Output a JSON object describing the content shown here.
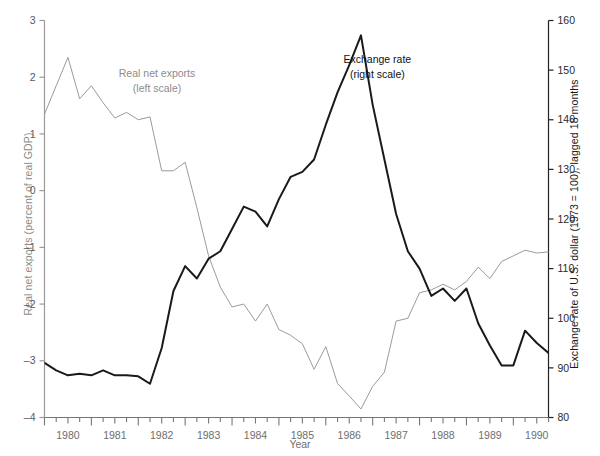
{
  "chart_data": {
    "type": "line",
    "title": "",
    "xlabel": "Year",
    "grid": false,
    "legend_position": "inline-annotations",
    "x_axis": {
      "label": "Year",
      "tick_labels": [
        "1980",
        "1981",
        "1982",
        "1983",
        "1984",
        "1985",
        "1986",
        "1987",
        "1988",
        "1989",
        "1990"
      ],
      "tick_values": [
        1980,
        1981,
        1982,
        1983,
        1984,
        1985,
        1986,
        1987,
        1988,
        1989,
        1990
      ],
      "minor_ticks": "quarterly",
      "xlim": [
        1979.5,
        1990.25
      ]
    },
    "y_axis_left": {
      "label": "Real net exports (percent of real GDP)",
      "tick_labels": [
        "3",
        "2",
        "1",
        "0",
        "–1",
        "–2",
        "–3",
        "–4"
      ],
      "tick_values": [
        3,
        2,
        1,
        0,
        -1,
        -2,
        -3,
        -4
      ],
      "ylim": [
        -4,
        3
      ],
      "color": "#8c8c8c"
    },
    "y_axis_right": {
      "label": "Exchange rate of U.S. dollar (1973 = 100), lagged 18 months",
      "tick_labels": [
        "160",
        "150",
        "140",
        "130",
        "120",
        "110",
        "100",
        "90",
        "80"
      ],
      "tick_values": [
        160,
        150,
        140,
        130,
        120,
        110,
        100,
        90,
        80
      ],
      "ylim": [
        80,
        160
      ],
      "color": "#1a1a1a"
    },
    "annotations": [
      {
        "name": "real-net-exports-label",
        "text": "Real net exports",
        "sub": "(left scale)",
        "color": "#8c8c8c",
        "x": 1981.9,
        "y": 2.0
      },
      {
        "name": "exchange-rate-label",
        "text": "Exchange rate",
        "sub": "(right scale)",
        "color": "#111111",
        "x": 1986.6,
        "y": 2.25
      }
    ],
    "series": [
      {
        "name": "Real net exports",
        "axis": "left",
        "color": "#9a9a9a",
        "unit": "percent of real GDP",
        "x": [
          1979.5,
          1979.75,
          1980.0,
          1980.25,
          1980.5,
          1980.75,
          1981.0,
          1981.25,
          1981.5,
          1981.75,
          1982.0,
          1982.25,
          1982.5,
          1982.75,
          1983.0,
          1983.25,
          1983.5,
          1983.75,
          1984.0,
          1984.25,
          1984.5,
          1984.75,
          1985.0,
          1985.25,
          1985.5,
          1985.75,
          1986.0,
          1986.25,
          1986.5,
          1986.75,
          1987.0,
          1987.25,
          1987.5,
          1987.75,
          1988.0,
          1988.25,
          1988.5,
          1988.75,
          1989.0,
          1989.25,
          1989.5,
          1989.75,
          1990.0,
          1990.25
        ],
        "y": [
          1.35,
          1.85,
          2.35,
          1.62,
          1.85,
          1.55,
          1.28,
          1.38,
          1.25,
          1.3,
          0.35,
          0.35,
          0.5,
          -0.3,
          -1.15,
          -1.7,
          -2.05,
          -2.0,
          -2.3,
          -2.0,
          -2.45,
          -2.55,
          -2.7,
          -3.15,
          -2.75,
          -3.4,
          -3.62,
          -3.85,
          -3.45,
          -3.2,
          -2.3,
          -2.25,
          -1.8,
          -1.75,
          -1.65,
          -1.75,
          -1.6,
          -1.35,
          -1.55,
          -1.25,
          -1.15,
          -1.05,
          -1.1,
          -1.08
        ]
      },
      {
        "name": "Exchange rate",
        "axis": "right",
        "color": "#1a1a1a",
        "unit": "index, 1973 = 100",
        "x": [
          1979.5,
          1979.75,
          1980.0,
          1980.25,
          1980.5,
          1980.75,
          1981.0,
          1981.25,
          1981.5,
          1981.75,
          1982.0,
          1982.25,
          1982.5,
          1982.75,
          1983.0,
          1983.25,
          1983.5,
          1983.75,
          1984.0,
          1984.25,
          1984.5,
          1984.75,
          1985.0,
          1985.25,
          1985.5,
          1985.75,
          1986.0,
          1986.25,
          1986.5,
          1986.75,
          1987.0,
          1987.25,
          1987.5,
          1987.75,
          1988.0,
          1988.25,
          1988.5,
          1988.75,
          1989.0,
          1989.25,
          1989.5,
          1989.75,
          1990.0,
          1990.25
        ],
        "y": [
          91.0,
          89.5,
          88.5,
          88.8,
          88.5,
          89.5,
          88.5,
          88.5,
          88.3,
          86.8,
          94.0,
          105.5,
          110.5,
          108.0,
          112.0,
          113.5,
          118.0,
          122.5,
          121.5,
          118.5,
          124.0,
          128.5,
          129.5,
          132.0,
          139.0,
          145.5,
          151.0,
          157.0,
          143.0,
          132.0,
          121.0,
          113.5,
          110.0,
          104.5,
          106.0,
          103.5,
          106.0,
          99.0,
          94.5,
          90.5,
          90.5,
          97.5,
          95.0,
          93.0
        ]
      }
    ]
  },
  "axis_titles": {
    "left": "Real net exports (percent of real GDP)",
    "right": "Exchange rate of U.S. dollar (1973 = 100), lagged 18 months",
    "bottom": "Year"
  }
}
